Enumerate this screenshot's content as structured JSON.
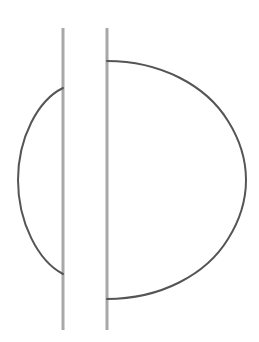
{
  "canvas": {
    "width": 259,
    "height": 342,
    "background_color": "#ffffff"
  },
  "figure": {
    "title": "",
    "stroke_colors": {
      "vertical_line": "#a8a8a8",
      "arc": "#555555"
    },
    "stroke_widths": {
      "vertical_line": 3,
      "arc": 2
    },
    "vertical_lines": [
      {
        "name": "left-vertical-line",
        "x": 63,
        "y_top": 28,
        "y_bottom": 330,
        "color": "#a8a8a8",
        "width": 3
      },
      {
        "name": "right-vertical-line",
        "x": 107,
        "y_top": 28,
        "y_bottom": 330,
        "color": "#a8a8a8",
        "width": 3
      }
    ],
    "arcs": [
      {
        "name": "left-arc",
        "path": "M 63 88 C 38 100 18 138 18 180 C 18 222 38 261 63 274",
        "start_point": [
          63,
          88
        ],
        "end_point": [
          63,
          274
        ],
        "extreme_point": [
          18,
          180
        ],
        "bulge_direction": "left",
        "color": "#555555",
        "width": 2
      },
      {
        "name": "right-arc",
        "path": "M 107 61 C 160 61 206 85 228 121 C 240 140 246 160 246 180 C 246 200 240 220 228 239 C 206 275 160 299 107 299",
        "start_point": [
          107,
          61
        ],
        "end_point": [
          107,
          299
        ],
        "extreme_point": [
          246,
          180
        ],
        "bulge_direction": "right",
        "color": "#555555",
        "width": 2
      }
    ]
  }
}
